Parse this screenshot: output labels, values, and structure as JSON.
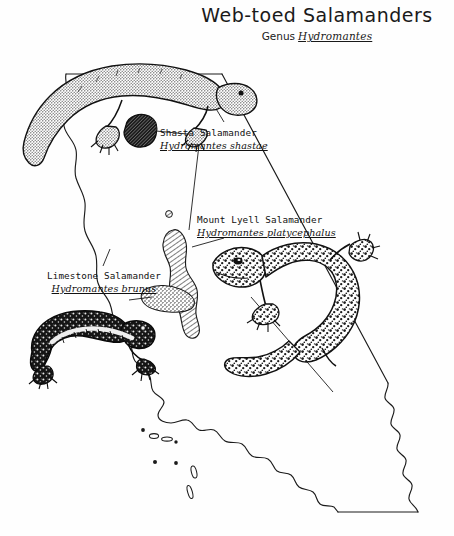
{
  "plate": {
    "title": "Web-toed Salamanders",
    "subtitle_prefix": "Genus",
    "subtitle_genus": "Hydromantes",
    "background_color": "#fefefe",
    "ink_color": "#111111"
  },
  "map": {
    "region_name": "California",
    "outline_style": "hand-drawn line",
    "islands_label": "Channel Islands"
  },
  "species": [
    {
      "id": "shasta",
      "common_name": "Shasta Salamander",
      "scientific_name": "Hydromantes shastae",
      "range_marker": "solid-dark-blob",
      "range_location": "northern interior"
    },
    {
      "id": "lyell",
      "common_name": "Mount Lyell Salamander",
      "scientific_name": "Hydromantes platycephalus",
      "range_marker": "diagonal-hatched-strip",
      "range_location": "Sierra Nevada"
    },
    {
      "id": "limestone",
      "common_name": "Limestone Salamander",
      "scientific_name": "Hydromantes brunus",
      "range_marker": "stippled-blob",
      "range_location": "central Sierra foothills"
    }
  ]
}
